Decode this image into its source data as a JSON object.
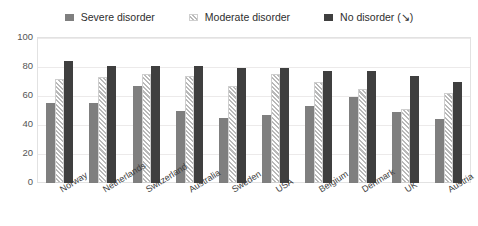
{
  "chart_data": {
    "type": "bar",
    "title": "",
    "subtitle": "",
    "xlabel": "",
    "ylabel": "",
    "ylim": [
      0,
      100
    ],
    "yticks": [
      0,
      20,
      40,
      60,
      80,
      100
    ],
    "grid": true,
    "legend_position": "top-center",
    "categories": [
      "Norway",
      "Netherlands",
      "Switzerland",
      "Australia",
      "Sweden",
      "USA",
      "Belgium",
      "Denmark",
      "UK",
      "Austria"
    ],
    "series": [
      {
        "name": "Severe disorder",
        "marker": "solid-gray-square",
        "color": "#7f7f7f",
        "values": [
          55,
          55,
          67,
          50,
          45,
          47,
          53,
          59,
          49,
          44
        ]
      },
      {
        "name": "Moderate disorder",
        "marker": "hatched-square",
        "color": "#b9b9b9",
        "values": [
          72,
          73,
          75,
          74,
          67,
          75,
          70,
          65,
          51,
          62
        ]
      },
      {
        "name": "No disorder (↘)",
        "marker": "solid-dark-square",
        "color": "#3f3f3f",
        "values": [
          84,
          81,
          81,
          81,
          79,
          79,
          77,
          77,
          74,
          70
        ]
      }
    ]
  },
  "legend": {
    "items": [
      {
        "label": "Severe disorder",
        "swatch": "severe"
      },
      {
        "label": "Moderate disorder",
        "swatch": "moderate"
      },
      {
        "label": "No disorder (↘)",
        "swatch": "none"
      }
    ]
  },
  "colors": {
    "severe": "#7f7f7f",
    "moderate": "#b9b9b9",
    "no_disorder": "#3f3f3f",
    "gridline": "#eceaea",
    "frame": "#e2e2e2",
    "text": "#3a3a3a"
  }
}
